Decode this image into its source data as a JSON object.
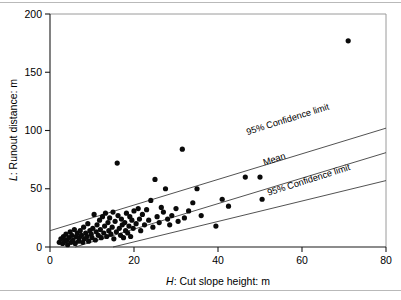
{
  "chart_data": {
    "type": "scatter",
    "title": "",
    "xlabel": "H: Cut slope height: m",
    "ylabel": "L: Runout distance: m",
    "xlabel_var": "H",
    "xlabel_rest": ": Cut slope height: m",
    "ylabel_var": "L",
    "ylabel_rest": ": Runout distance: m",
    "xlim": [
      0,
      80
    ],
    "ylim": [
      0,
      200
    ],
    "xticks": [
      0,
      20,
      40,
      60,
      80
    ],
    "yticks": [
      0,
      50,
      100,
      150,
      200
    ],
    "xtick_labels": [
      "0",
      "20",
      "40",
      "60",
      "80"
    ],
    "ytick_labels": [
      "0",
      "50",
      "100",
      "150",
      "200"
    ],
    "grid": false,
    "legend_position": "inline-annotations",
    "marker": {
      "shape": "circle",
      "color": "#0a0a0a",
      "size_px": 5.2
    },
    "annotations": [
      {
        "name": "upper-confidence-limit-label",
        "text": "95% Confidence limit",
        "x": 47,
        "y": 96,
        "rotation": -17.5
      },
      {
        "name": "mean-label",
        "text": "Mean",
        "x": 51,
        "y": 70,
        "rotation": -17.5
      },
      {
        "name": "lower-confidence-limit-label",
        "text": "95% Confidence limit",
        "x": 52,
        "y": 44,
        "rotation": -17.5
      }
    ],
    "series": [
      {
        "name": "Upper 95% confidence limit",
        "type": "line",
        "points": [
          [
            0,
            14
          ],
          [
            80,
            102
          ]
        ]
      },
      {
        "name": "Mean",
        "type": "line",
        "points": [
          [
            6,
            0
          ],
          [
            80,
            81
          ]
        ]
      },
      {
        "name": "Lower 95% confidence limit",
        "type": "line",
        "points": [
          [
            15,
            0
          ],
          [
            80,
            57
          ]
        ]
      },
      {
        "name": "Landslide runout observations",
        "type": "scatter",
        "points": [
          [
            2.2,
            4
          ],
          [
            2.6,
            7
          ],
          [
            3.0,
            3
          ],
          [
            3.2,
            9
          ],
          [
            3.5,
            5
          ],
          [
            3.8,
            11
          ],
          [
            4.0,
            6
          ],
          [
            4.2,
            2
          ],
          [
            4.5,
            8
          ],
          [
            4.8,
            13
          ],
          [
            5.0,
            4
          ],
          [
            5.2,
            10
          ],
          [
            5.5,
            6
          ],
          [
            5.8,
            15
          ],
          [
            6.0,
            3
          ],
          [
            6.2,
            9
          ],
          [
            6.5,
            12
          ],
          [
            6.8,
            5
          ],
          [
            7.0,
            8
          ],
          [
            7.2,
            14
          ],
          [
            7.5,
            10
          ],
          [
            7.8,
            4
          ],
          [
            8.0,
            17
          ],
          [
            8.2,
            7
          ],
          [
            8.5,
            12
          ],
          [
            8.8,
            9
          ],
          [
            9.0,
            20
          ],
          [
            9.2,
            5
          ],
          [
            9.5,
            14
          ],
          [
            9.8,
            11
          ],
          [
            10.0,
            8
          ],
          [
            10.2,
            16
          ],
          [
            10.5,
            28
          ],
          [
            10.8,
            6
          ],
          [
            11.0,
            13
          ],
          [
            11.2,
            19
          ],
          [
            11.5,
            10
          ],
          [
            11.8,
            23
          ],
          [
            12.0,
            15
          ],
          [
            12.2,
            8
          ],
          [
            12.5,
            26
          ],
          [
            12.8,
            12
          ],
          [
            13.0,
            18
          ],
          [
            13.2,
            29
          ],
          [
            13.5,
            9
          ],
          [
            13.8,
            21
          ],
          [
            14.0,
            14
          ],
          [
            14.2,
            25
          ],
          [
            14.5,
            11
          ],
          [
            14.8,
            17
          ],
          [
            15.0,
            30
          ],
          [
            15.2,
            7
          ],
          [
            15.5,
            22
          ],
          [
            15.8,
            13
          ],
          [
            16.0,
            72
          ],
          [
            16.2,
            27
          ],
          [
            16.5,
            16
          ],
          [
            16.8,
            10
          ],
          [
            17.0,
            24
          ],
          [
            17.2,
            19
          ],
          [
            17.5,
            8
          ],
          [
            17.8,
            21
          ],
          [
            18.0,
            14
          ],
          [
            18.2,
            29
          ],
          [
            18.5,
            12
          ],
          [
            18.8,
            18
          ],
          [
            19.0,
            26
          ],
          [
            19.2,
            9
          ],
          [
            19.5,
            23
          ],
          [
            19.8,
            16
          ],
          [
            20.0,
            31
          ],
          [
            20.5,
            20
          ],
          [
            21.0,
            33
          ],
          [
            21.3,
            24
          ],
          [
            21.6,
            14
          ],
          [
            22.0,
            28
          ],
          [
            22.5,
            19
          ],
          [
            23.0,
            32
          ],
          [
            23.5,
            23
          ],
          [
            24.0,
            40
          ],
          [
            24.5,
            17
          ],
          [
            25.0,
            58
          ],
          [
            25.5,
            26
          ],
          [
            26.0,
            21
          ],
          [
            26.5,
            34
          ],
          [
            27.0,
            30
          ],
          [
            27.5,
            50
          ],
          [
            28.0,
            24
          ],
          [
            28.5,
            19
          ],
          [
            29.0,
            27
          ],
          [
            30.0,
            33
          ],
          [
            30.5,
            22
          ],
          [
            31.5,
            84
          ],
          [
            32.0,
            25
          ],
          [
            33.0,
            31
          ],
          [
            34.0,
            38
          ],
          [
            35.0,
            50
          ],
          [
            36.0,
            27
          ],
          [
            39.5,
            18
          ],
          [
            41.0,
            41
          ],
          [
            42.5,
            35
          ],
          [
            46.5,
            60
          ],
          [
            50.0,
            60
          ],
          [
            50.5,
            41
          ],
          [
            71.0,
            177
          ]
        ]
      }
    ]
  },
  "figure": {
    "axis_color": "#1a1a1a",
    "line_color": "#333333",
    "marker_color": "#0a0a0a",
    "frame_color": "#b9b9b9",
    "background": "#ffffff"
  }
}
